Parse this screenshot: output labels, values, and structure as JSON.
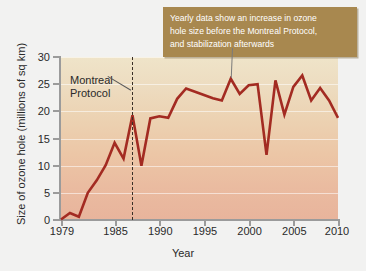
{
  "chart_data": {
    "type": "line",
    "title": "",
    "xlabel": "Year",
    "ylabel": "Size of ozone hole (millions of sq km)",
    "xlim": [
      1979,
      2010
    ],
    "ylim": [
      0,
      30
    ],
    "xticks": [
      "1979",
      "1985",
      "1990",
      "1995",
      "2000",
      "2005",
      "2010"
    ],
    "xtick_values": [
      1979,
      1985,
      1990,
      1995,
      2000,
      2005,
      2010
    ],
    "yticks": [
      "0",
      "5",
      "10",
      "15",
      "20",
      "25",
      "30"
    ],
    "ytick_values": [
      0,
      5,
      10,
      15,
      20,
      25,
      30
    ],
    "grid": "horizontal",
    "legend": "none",
    "series": [
      {
        "name": "Size of ozone hole",
        "color": "#a32b22",
        "x": [
          1979,
          1980,
          1981,
          1982,
          1983,
          1984,
          1985,
          1986,
          1987,
          1988,
          1989,
          1990,
          1991,
          1992,
          1993,
          1994,
          1995,
          1996,
          1997,
          1998,
          1999,
          2000,
          2001,
          2002,
          2003,
          2004,
          2005,
          2006,
          2007,
          2008,
          2009,
          2010
        ],
        "values": [
          0.1,
          1.3,
          0.6,
          5.0,
          7.3,
          10.1,
          14.2,
          11.3,
          19.3,
          10.0,
          18.7,
          19.1,
          18.8,
          22.3,
          24.2,
          23.6,
          23.0,
          22.4,
          22.0,
          26.0,
          23.2,
          24.8,
          25.0,
          12.0,
          25.7,
          19.4,
          24.5,
          26.6,
          22.0,
          24.3,
          22.0,
          18.8
        ]
      }
    ],
    "annotations": [
      {
        "name": "montreal-protocol",
        "label": "Montreal\nProtocol",
        "event_year": 1987,
        "marker": "vertical-dashed-line"
      },
      {
        "name": "callout",
        "lines": [
          "Yearly data show an increase in ozone",
          "hole size before the Montreal Protocol,",
          "and stabilization afterwards"
        ],
        "points_to_year": 1998,
        "background": "#a8884f",
        "text_color": "#ffffff"
      }
    ],
    "colors": {
      "line": "#a32b22",
      "plot_bg_top": "#efe4c9",
      "plot_bg_bottom": "#e8b49c",
      "axis": "#9b9b9b",
      "callout_bg": "#a8884f",
      "event_line": "#3a3027",
      "page_bg": "#f2f2f1"
    }
  }
}
